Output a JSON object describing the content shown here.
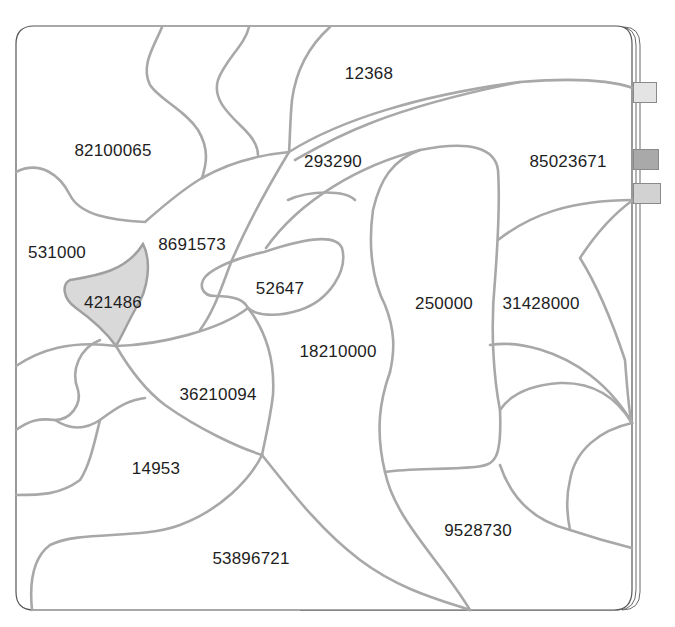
{
  "puzzle": {
    "line_color": "#a8a8a8",
    "highlight_fill": "#d9d9d9",
    "regions": [
      {
        "label": "12368",
        "x": 369,
        "y": 73
      },
      {
        "label": "82100065",
        "x": 113,
        "y": 150
      },
      {
        "label": "293290",
        "x": 333,
        "y": 161
      },
      {
        "label": "85023671",
        "x": 568,
        "y": 161
      },
      {
        "label": "531000",
        "x": 57,
        "y": 252
      },
      {
        "label": "8691573",
        "x": 192,
        "y": 244
      },
      {
        "label": "421486",
        "x": 113,
        "y": 302,
        "highlighted": true
      },
      {
        "label": "52647",
        "x": 280,
        "y": 288
      },
      {
        "label": "250000",
        "x": 444,
        "y": 303
      },
      {
        "label": "31428000",
        "x": 541,
        "y": 303
      },
      {
        "label": "18210000",
        "x": 338,
        "y": 351
      },
      {
        "label": "36210094",
        "x": 218,
        "y": 394
      },
      {
        "label": "14953",
        "x": 156,
        "y": 468
      },
      {
        "label": "9528730",
        "x": 478,
        "y": 530
      },
      {
        "label": "53896721",
        "x": 251,
        "y": 558
      }
    ]
  },
  "tabs": [
    {
      "name": "tab-light",
      "color": "#e4e4e4",
      "x": 633,
      "y": 82,
      "w": 24,
      "h": 21
    },
    {
      "name": "tab-dark",
      "color": "#a9a9a9",
      "x": 633,
      "y": 149,
      "w": 26,
      "h": 21
    },
    {
      "name": "tab-medium",
      "color": "#d2d2d2",
      "x": 633,
      "y": 183,
      "w": 28,
      "h": 21
    }
  ]
}
